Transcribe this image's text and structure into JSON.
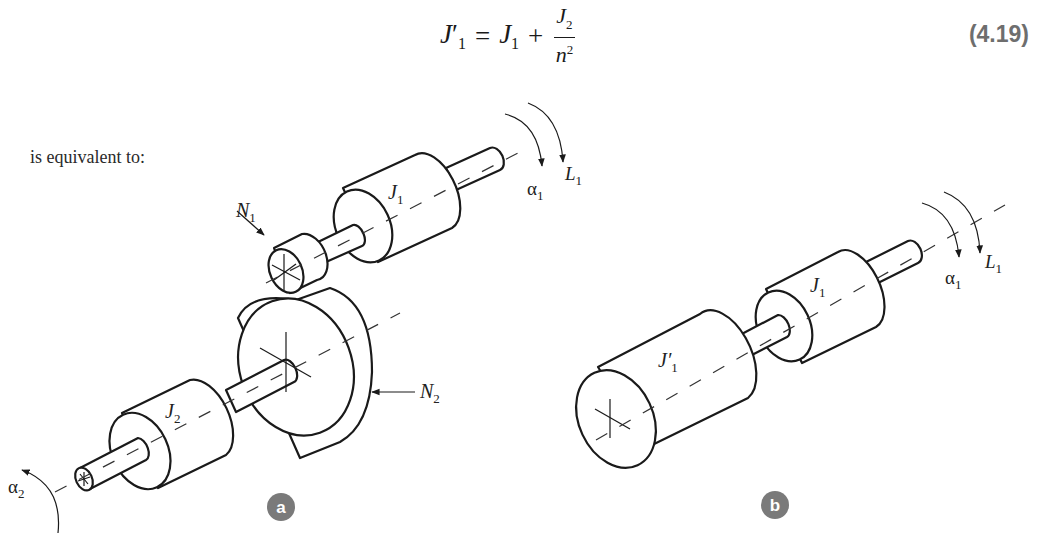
{
  "equation": {
    "lhs": "J",
    "lhs_prime": "′",
    "lhs_sub": "1",
    "equals": "=",
    "term1": "J",
    "term1_sub": "1",
    "plus": "+",
    "numerator": "J",
    "numerator_sub": "2",
    "denominator": "n",
    "denominator_sup": "2",
    "number": "(4.19)"
  },
  "body_text": "is equivalent to:",
  "figure_a": {
    "badge": "a",
    "labels": {
      "N1": {
        "base": "N",
        "sub": "1"
      },
      "N2": {
        "base": "N",
        "sub": "2"
      },
      "J1": {
        "base": "J",
        "sub": "1"
      },
      "J2": {
        "base": "J",
        "sub": "2"
      },
      "alpha1": {
        "base": "α",
        "sub": "1"
      },
      "L1": {
        "base": "L",
        "sub": "1"
      },
      "alpha2": {
        "base": "α",
        "sub": "2"
      }
    }
  },
  "figure_b": {
    "badge": "b",
    "labels": {
      "J1prime": {
        "base": "J′",
        "sub": "1"
      },
      "J1": {
        "base": "J",
        "sub": "1"
      },
      "alpha1": {
        "base": "α",
        "sub": "1"
      },
      "L1": {
        "base": "L",
        "sub": "1"
      }
    }
  },
  "colors": {
    "badge": "#7a7a7a",
    "eq_number": "#6e6e6e",
    "ink": "#1a1a1a"
  }
}
